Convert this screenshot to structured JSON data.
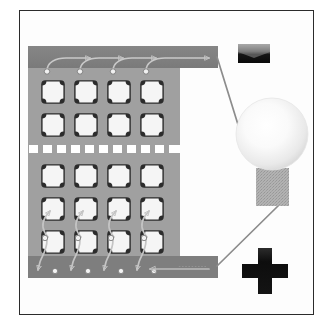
{
  "diagram": {
    "title": "Solar photovoltaic module wired to a light bulb",
    "background_color": "#ffffff",
    "frame": {
      "border_color": "#2b2b2b",
      "fill_color": "#fdfdfd",
      "x": 19,
      "y": 10,
      "width": 295,
      "height": 305
    }
  },
  "panel": {
    "name": "solar-panel",
    "body_color": "#a0a0a0",
    "body": {
      "x": 28,
      "y": 46,
      "width": 152,
      "height": 232
    },
    "busbar_color": "#808080",
    "busbar_top": {
      "x": 28,
      "y": 46,
      "width": 190,
      "height": 22
    },
    "busbar_bottom": {
      "x": 28,
      "y": 256,
      "width": 190,
      "height": 22
    },
    "divider": {
      "name": "dashed-separator",
      "color": "#ffffff",
      "y": 145,
      "dash_count": 11,
      "dash_width": 9,
      "dash_height": 8,
      "gap": 5,
      "x_start": 29
    },
    "cells": {
      "rows": 5,
      "columns": 4,
      "cell_color": "#f2f2f2",
      "cell_outline_color": "#2a2a2a",
      "cell_size": 26,
      "x_positions": [
        40,
        73,
        106,
        139
      ],
      "y_positions": [
        79,
        112,
        163,
        196,
        229
      ],
      "shape": "pseudo-square-notched"
    },
    "contact_dots": {
      "color": "#f0f0f0",
      "outline": "#6b6b6b",
      "top_row_y": 71,
      "mid_row_y": 232,
      "bottom_row_y": 268,
      "x_positions": [
        46,
        79,
        112,
        145
      ]
    }
  },
  "current_flow": {
    "arrow_color": "#c9c9c9",
    "top_arrows": {
      "name": "top-busbar-current-arrows",
      "direction": "right",
      "count": 4,
      "label": "electron flow to negative terminal"
    },
    "bottom_arrows": {
      "name": "bottom-busbar-current-arrows",
      "direction": "left",
      "count": 1,
      "label": "current return to positive terminal"
    },
    "interconnect_count": 8,
    "interconnect_label": "cell interconnect ribbons"
  },
  "terminals": [
    {
      "id": "negative",
      "name": "negative-terminal-marker",
      "symbol": "−",
      "sign": "minus",
      "color": "#101010",
      "x": 238,
      "y": 44,
      "width": 32,
      "height": 19
    },
    {
      "id": "positive",
      "name": "positive-terminal-marker",
      "symbol": "+",
      "sign": "plus",
      "color": "#101010",
      "x": 242,
      "y": 248,
      "width": 46,
      "height": 46
    }
  ],
  "bulb": {
    "name": "light-bulb",
    "glass": {
      "cx": 272,
      "cy": 134,
      "r": 36,
      "fill_center": "#ffffff",
      "fill_edge": "#d8d8d8",
      "outline": "#e2e2e2"
    },
    "base": {
      "x": 256,
      "y": 168,
      "width": 33,
      "height": 38,
      "fill": "#adadad",
      "texture": "dithered-hatch",
      "label": "screw base"
    },
    "state": "lit"
  },
  "wires": [
    {
      "name": "wire-negative-to-bulb",
      "color": "#8c8c8c",
      "from": "top-busbar-right-end",
      "to": "bulb-glass-left",
      "x1": 217,
      "y1": 58,
      "x2": 248,
      "y2": 161
    },
    {
      "name": "wire-bulb-to-positive",
      "color": "#8c8c8c",
      "from": "bulb-base-bottom",
      "to": "bottom-busbar-right-end",
      "x1": 278,
      "y1": 206,
      "x2": 217,
      "y2": 266
    }
  ]
}
